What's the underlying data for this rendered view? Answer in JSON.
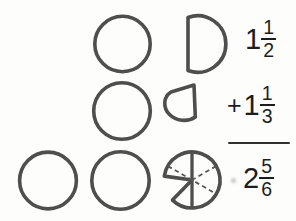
{
  "background": "#fdfdfb",
  "colors": {
    "shape_stroke": "#4e4e4e",
    "text": "#1d1d1d",
    "rule_line": "#2f2f2f",
    "dashed_divider": "#585858"
  },
  "equation": {
    "rows": [
      {
        "operator": "",
        "whole": "1",
        "numerator": "1",
        "denominator": "2"
      },
      {
        "operator": "+",
        "whole": "1",
        "numerator": "1",
        "denominator": "3"
      },
      {
        "operator": "",
        "whole": "2",
        "numerator": "5",
        "denominator": "6"
      }
    ]
  },
  "models": {
    "row1": [
      "whole-circle",
      "one-half-circle-piece"
    ],
    "row2": [
      "whole-circle",
      "one-third-circle-piece"
    ],
    "row3": [
      "whole-circle",
      "whole-circle",
      "five-sixths-circle-with-dashed-sixths"
    ]
  }
}
